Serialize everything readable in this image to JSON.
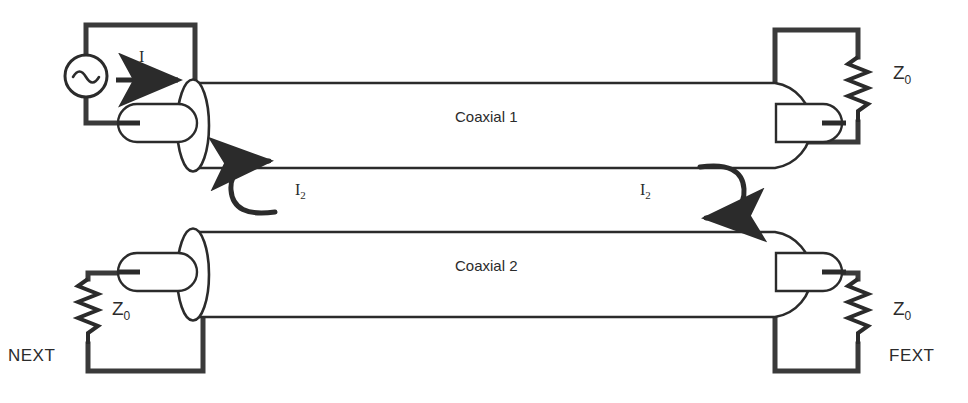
{
  "figure": {
    "type": "circuit-schematic",
    "background_color": "#ffffff",
    "line_color": "#2b2b2b",
    "thick_line_color": "#3a3a3a"
  },
  "cables": [
    {
      "id": "coaxial-1",
      "label": "Coaxial 1",
      "label_x": 455,
      "label_y": 116,
      "body": {
        "x": 195,
        "y": 83,
        "width": 580,
        "height": 85
      },
      "left_cap": "ellipse",
      "right_cap": "half-round"
    },
    {
      "id": "coaxial-2",
      "label": "Coaxial 2",
      "label_x": 455,
      "label_y": 265,
      "body": {
        "x": 195,
        "y": 232,
        "width": 580,
        "height": 85
      },
      "left_cap": "ellipse",
      "right_cap": "half-round"
    }
  ],
  "source": {
    "name": "ac-source",
    "symbol": "sine-wave-in-circle",
    "cx": 86,
    "cy": 76,
    "r": 21
  },
  "currents": [
    {
      "id": "drive-current",
      "label": "I",
      "label_x": 139,
      "label_y": 58,
      "arrow": "straight-right",
      "x1": 116,
      "y1": 80,
      "x2": 186,
      "y2": 80
    },
    {
      "id": "induced-current-left",
      "label": "I2",
      "label_text": "I",
      "subscript": "2",
      "label_x": 295,
      "label_y": 189,
      "arrow": "loop-counterclockwise-arrowhead-top-right"
    },
    {
      "id": "induced-current-right",
      "label": "I2",
      "label_text": "I",
      "subscript": "2",
      "label_x": 640,
      "label_y": 189,
      "arrow": "loop-clockwise-arrowhead-bottom-left"
    }
  ],
  "terminations": [
    {
      "id": "termination-top-right",
      "label_text": "Z",
      "subscript": "0",
      "label_x": 893,
      "label_y": 62,
      "port_label": null,
      "resistor_orientation": "vertical"
    },
    {
      "id": "termination-bottom-left",
      "label_text": "Z",
      "subscript": "0",
      "label_x": 112,
      "label_y": 310,
      "port_label": "NEXT",
      "port_label_x": 8,
      "port_label_y": 357,
      "resistor_orientation": "vertical"
    },
    {
      "id": "termination-bottom-right",
      "label_text": "Z",
      "subscript": "0",
      "label_x": 893,
      "label_y": 310,
      "port_label": "FEXT",
      "port_label_x": 889,
      "port_label_y": 357,
      "resistor_orientation": "vertical"
    }
  ],
  "connectors": [
    {
      "id": "connector-top-left",
      "x": 118,
      "y": 104,
      "width": 78,
      "height": 38
    },
    {
      "id": "connector-top-right",
      "x": 772,
      "y": 104,
      "width": 70,
      "height": 38
    },
    {
      "id": "connector-bottom-left",
      "x": 118,
      "y": 253,
      "width": 78,
      "height": 38
    },
    {
      "id": "connector-bottom-right",
      "x": 772,
      "y": 253,
      "width": 70,
      "height": 38
    }
  ]
}
